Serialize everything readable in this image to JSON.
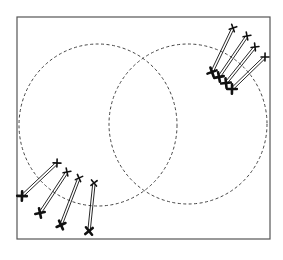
{
  "diagram": {
    "type": "schematic",
    "frame": {
      "x1": 17,
      "y1": 17,
      "x2": 270,
      "y2": 239,
      "stroke": "#555555"
    },
    "circles": [
      {
        "id": "left-circle",
        "cx": 98,
        "cy": 125,
        "rx": 79,
        "ry": 81,
        "stroke": "#444444",
        "dash": "3 2.5"
      },
      {
        "id": "right-circle",
        "cx": 188,
        "cy": 124,
        "rx": 79,
        "ry": 80,
        "stroke": "#444444",
        "dash": "3 2.5"
      }
    ],
    "rod_groups": [
      {
        "id": "top-right-group",
        "rods": [
          {
            "top": [
              233,
              28
            ],
            "bottom": [
              212,
              72
            ]
          },
          {
            "top": [
              247,
              36
            ],
            "bottom": [
              219,
              77
            ]
          },
          {
            "top": [
              255,
              47
            ],
            "bottom": [
              226,
              83
            ]
          },
          {
            "top": [
              265,
              57
            ],
            "bottom": [
              232,
              89
            ]
          }
        ]
      },
      {
        "id": "bottom-left-group",
        "rods": [
          {
            "top": [
              57,
              163
            ],
            "bottom": [
              22,
              196
            ]
          },
          {
            "top": [
              67,
              172
            ],
            "bottom": [
              40,
              213
            ]
          },
          {
            "top": [
              79,
              178
            ],
            "bottom": [
              61,
              225
            ]
          },
          {
            "top": [
              94,
              183
            ],
            "bottom": [
              89,
              231
            ]
          }
        ]
      }
    ],
    "rod_style": {
      "stroke": "#111111",
      "gap": 2.4,
      "line_width": 0.9
    },
    "marker_style": {
      "top": "thin-cross",
      "bottom": "bold-cross",
      "color": "#111111"
    }
  }
}
